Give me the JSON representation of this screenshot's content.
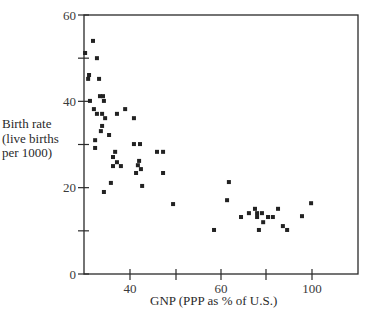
{
  "chart_data": {
    "type": "scatter",
    "title": "",
    "xlabel": "GNP (PPP as % of U.S.)",
    "ylabel_lines": [
      "Birth rate",
      "(live births",
      "per 1000)"
    ],
    "ylabel": "Birth rate (live births per 1000)",
    "x_ticks": [
      {
        "label": "40",
        "px": 130
      },
      {
        "label": "",
        "px": 176
      },
      {
        "label": "60",
        "px": 221
      },
      {
        "label": "",
        "px": 266
      },
      {
        "label": "100",
        "px": 312
      }
    ],
    "y_ticks": [
      {
        "label": "0",
        "value": 0
      },
      {
        "label": "",
        "value": 10
      },
      {
        "label": "20",
        "value": 20
      },
      {
        "label": "",
        "value": 30
      },
      {
        "label": "40",
        "value": 40
      },
      {
        "label": "",
        "value": 50
      },
      {
        "label": "60",
        "value": 60
      }
    ],
    "xlim": [
      24.8,
      115.9
    ],
    "ylim": [
      0,
      60
    ],
    "grid": false,
    "legend": null,
    "marker": "square",
    "marker_color": "#222222",
    "points": [
      [
        25.2,
        51.2
      ],
      [
        27.8,
        54.0
      ],
      [
        29.1,
        50.0
      ],
      [
        26.5,
        46.1
      ],
      [
        26.2,
        45.2
      ],
      [
        29.8,
        45.2
      ],
      [
        30.1,
        41.2
      ],
      [
        31.1,
        41.2
      ],
      [
        31.4,
        40.1
      ],
      [
        26.8,
        40.1
      ],
      [
        28.1,
        38.2
      ],
      [
        29.1,
        37.1
      ],
      [
        30.8,
        37.1
      ],
      [
        31.8,
        36.1
      ],
      [
        35.7,
        37.1
      ],
      [
        38.4,
        38.2
      ],
      [
        41.3,
        36.1
      ],
      [
        30.8,
        34.3
      ],
      [
        30.4,
        33.1
      ],
      [
        33.1,
        32.2
      ],
      [
        28.5,
        31.0
      ],
      [
        28.5,
        29.2
      ],
      [
        41.3,
        30.1
      ],
      [
        43.3,
        30.1
      ],
      [
        35.1,
        28.3
      ],
      [
        34.4,
        27.1
      ],
      [
        35.7,
        25.9
      ],
      [
        34.4,
        25.0
      ],
      [
        37.0,
        25.0
      ],
      [
        43.0,
        26.2
      ],
      [
        42.6,
        25.2
      ],
      [
        42.0,
        23.4
      ],
      [
        43.6,
        24.3
      ],
      [
        48.9,
        28.3
      ],
      [
        50.9,
        28.3
      ],
      [
        50.9,
        23.4
      ],
      [
        33.7,
        21.1
      ],
      [
        44.0,
        20.4
      ],
      [
        31.4,
        19.0
      ],
      [
        54.2,
        16.2
      ],
      [
        72.6,
        21.3
      ],
      [
        72.0,
        17.1
      ],
      [
        67.7,
        10.2
      ],
      [
        76.6,
        13.2
      ],
      [
        79.2,
        14.1
      ],
      [
        81.2,
        15.1
      ],
      [
        81.9,
        14.1
      ],
      [
        83.5,
        14.1
      ],
      [
        81.9,
        13.2
      ],
      [
        85.5,
        13.2
      ],
      [
        87.1,
        13.2
      ],
      [
        88.8,
        15.1
      ],
      [
        83.9,
        12.0
      ],
      [
        82.5,
        10.2
      ],
      [
        90.4,
        11.1
      ],
      [
        91.8,
        10.2
      ],
      [
        96.7,
        13.4
      ],
      [
        99.7,
        16.4
      ]
    ]
  },
  "labels": {
    "ylabel_line1": "Birth rate",
    "ylabel_line2": "(live births",
    "ylabel_line3": "per 1000)",
    "xlabel": "GNP (PPP as % of U.S.)"
  }
}
